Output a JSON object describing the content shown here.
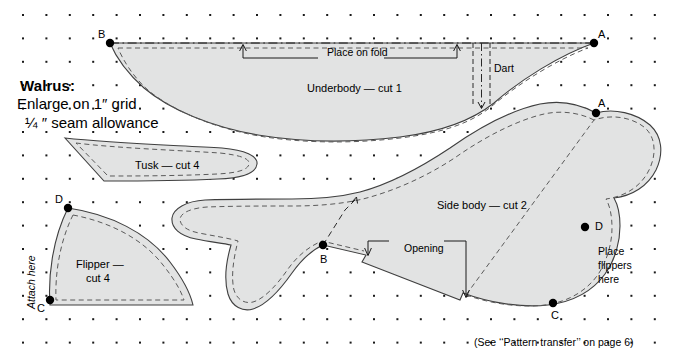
{
  "document": {
    "kind": "sewing-pattern-diagram",
    "subject": "Walrus"
  },
  "instructions": {
    "title": "Walrus:",
    "line1": "Enlarge on 1″ grid",
    "line2": "¼ ″ seam allowance"
  },
  "pieces": [
    {
      "id": "underbody",
      "label": "Underbody — cut 1"
    },
    {
      "id": "tusk",
      "label": "Tusk — cut 4"
    },
    {
      "id": "flipper",
      "label_line1": "Flipper —",
      "label_line2": "cut 4"
    },
    {
      "id": "sidebody",
      "label": "Side body — cut 2"
    }
  ],
  "annotations": {
    "place_on_fold": "Place on fold",
    "dart": "Dart",
    "opening": "Opening",
    "attach_here": "Attach here",
    "place_flippers_here_l1": "Place",
    "place_flippers_here_l2": "flippers",
    "place_flippers_here_l3": "here"
  },
  "match_points": [
    {
      "letter": "B",
      "piece": "underbody",
      "x": 110,
      "y": 43
    },
    {
      "letter": "A",
      "piece": "underbody",
      "x": 594,
      "y": 43
    },
    {
      "letter": "A",
      "piece": "sidebody",
      "x": 596,
      "y": 113
    },
    {
      "letter": "D",
      "piece": "sidebody",
      "x": 585,
      "y": 227
    },
    {
      "letter": "C",
      "piece": "sidebody",
      "x": 553,
      "y": 303
    },
    {
      "letter": "B",
      "piece": "sidebody",
      "x": 323,
      "y": 245
    },
    {
      "letter": "D",
      "piece": "flipper",
      "x": 68,
      "y": 208
    },
    {
      "letter": "C",
      "piece": "flipper",
      "x": 50,
      "y": 300
    }
  ],
  "point_letters": {
    "b_underbody": "B",
    "a_underbody": "A",
    "a_sidebody": "A",
    "d_sidebody": "D",
    "c_sidebody": "C",
    "b_sidebody": "B",
    "d_flipper": "D",
    "c_flipper": "C"
  },
  "caption": "(See ‘‘Pattern transfer’’ on page 6)",
  "grid": {
    "dot_color": "#1a1a1a",
    "x_start": 23,
    "y_start": 15,
    "spacing": 23.4,
    "cols": 28,
    "rows": 15,
    "note": "1 inch grid of dots"
  },
  "colors": {
    "piece_fill": "#e2e3e3",
    "outline": "#3f3f3f",
    "seam_dash": "#5a5a5a",
    "text": "#000000",
    "background": "#ffffff"
  }
}
